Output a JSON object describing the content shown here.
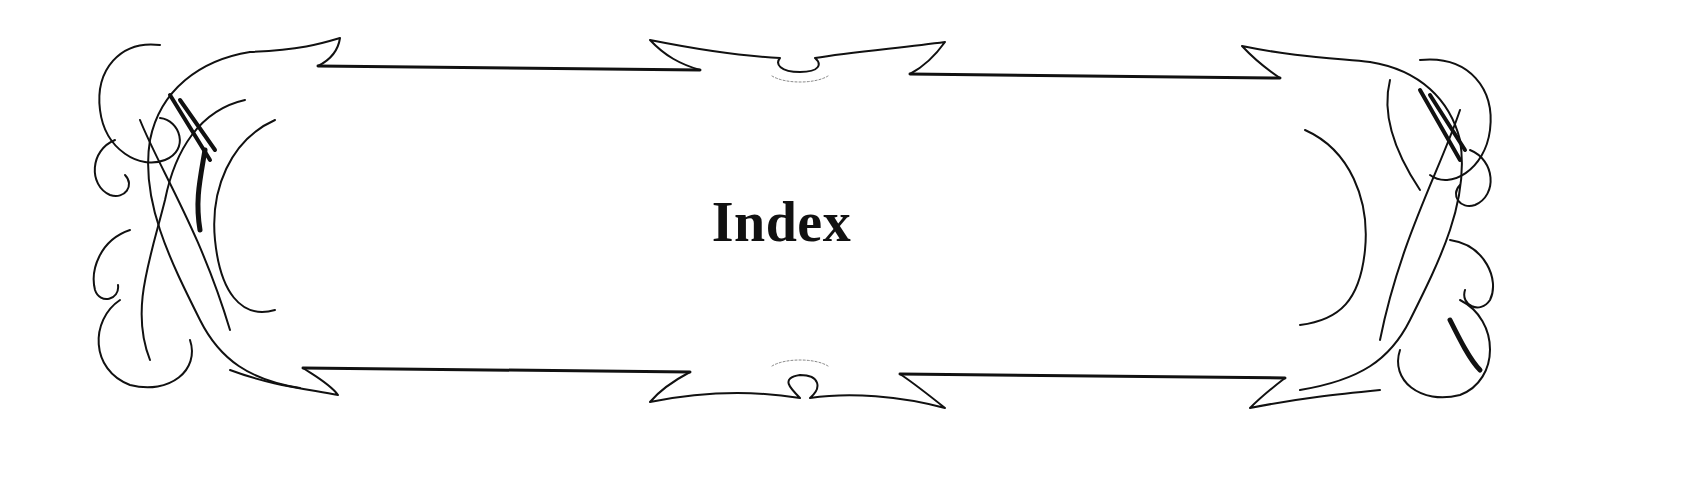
{
  "page": {
    "title": "Index"
  },
  "ornament": {
    "type": "decorative-ribbon-cartouche",
    "ink_color": "#111111",
    "background_color": "#ffffff"
  }
}
